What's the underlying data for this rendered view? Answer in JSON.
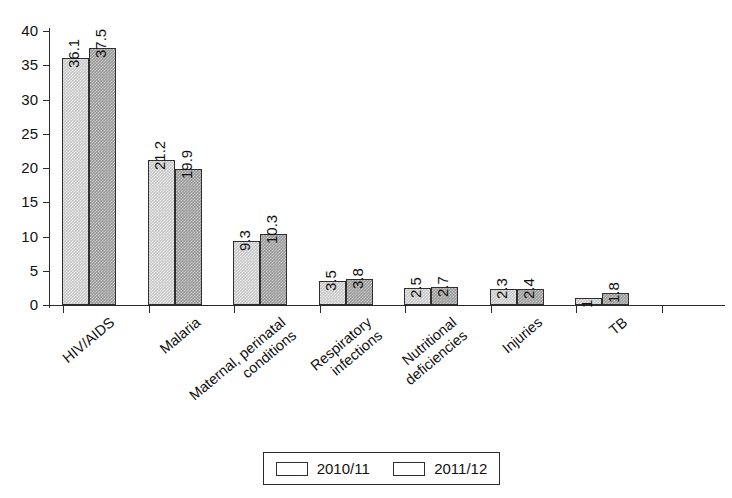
{
  "chart_data": {
    "type": "bar",
    "title": "",
    "subtitle": "",
    "xlabel": "",
    "ylabel": "",
    "ylim": [
      0,
      40
    ],
    "yticks": [
      0,
      5,
      10,
      15,
      20,
      25,
      30,
      35,
      40
    ],
    "grid": false,
    "legend_position": "bottom",
    "categories": [
      "HIV/AIDS",
      "Malaria",
      "Maternal, perinatal conditions",
      "Respiratory infections",
      "Nutritional deficiencies",
      "Injuries",
      "TB"
    ],
    "category_lines": [
      [
        "HIV/AIDS"
      ],
      [
        "Malaria"
      ],
      [
        "Maternal, perinatal",
        "conditions"
      ],
      [
        "Respiratory",
        "infections"
      ],
      [
        "Nutritional",
        "deficiencies"
      ],
      [
        "Injuries"
      ],
      [
        "TB"
      ]
    ],
    "series": [
      {
        "name": "2010/11",
        "color": "#c9c9c9",
        "values": [
          36.1,
          21.2,
          9.3,
          3.5,
          2.5,
          2.3,
          1
        ],
        "labels": [
          "36.1",
          "21.2",
          "9.3",
          "3.5",
          "2.5",
          "2.3",
          "1"
        ]
      },
      {
        "name": "2011/12",
        "color": "#9b9b9b",
        "values": [
          37.5,
          19.9,
          10.3,
          3.8,
          2.7,
          2.4,
          1.8
        ],
        "labels": [
          "37.5",
          "19.9",
          "10.3",
          "3.8",
          "2.7",
          "2.4",
          "1.8"
        ]
      }
    ]
  },
  "legend": {
    "entries": [
      {
        "label": "2010/11",
        "swatch": "legend-swatch-2010"
      },
      {
        "label": "2011/12",
        "swatch": "legend-swatch-2011"
      }
    ]
  }
}
